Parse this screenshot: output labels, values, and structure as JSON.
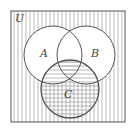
{
  "diagram": {
    "type": "venn",
    "universe_label": "U",
    "sets": [
      {
        "label": "A",
        "cx": 53,
        "cy": 55,
        "r": 29
      },
      {
        "label": "B",
        "cx": 86,
        "cy": 55,
        "r": 29
      },
      {
        "label": "C",
        "cx": 70,
        "cy": 89,
        "r": 29
      }
    ],
    "shading": {
      "outside_all": "vertical-lines",
      "C_only": "crosshatch",
      "C_intersect_A_or_B": "horizontal-lines",
      "A_or_B_outside_C": "none"
    },
    "colors": {
      "line": "#555555",
      "hatch": "#9a9a9a",
      "background": "#ffffff"
    }
  }
}
